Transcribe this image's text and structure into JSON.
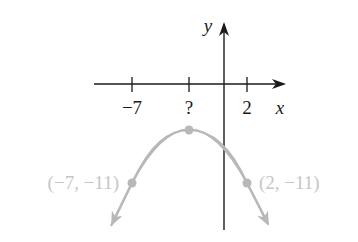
{
  "diagram": {
    "type": "parabola-graph",
    "axes": {
      "x_label": "x",
      "y_label": "y",
      "axis_color": "#1a1a1a"
    },
    "ticks": [
      {
        "label": "−7",
        "value": -7
      },
      {
        "label": "?",
        "value": null
      },
      {
        "label": "2",
        "value": 2
      }
    ],
    "curve": {
      "shape": "downward-opening parabola",
      "color": "#b8b8b8",
      "vertex_label": "?"
    },
    "points": [
      {
        "label": "(−7, −11)",
        "x": -7,
        "y": -11
      },
      {
        "label": "(2, −11)",
        "x": 2,
        "y": -11
      }
    ],
    "label_color": "#c6c6c6"
  }
}
